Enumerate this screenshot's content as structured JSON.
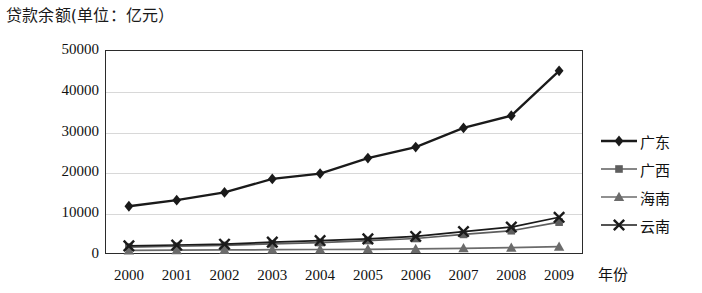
{
  "chart_data": {
    "type": "line",
    "title": "贷款余额(单位：亿元）",
    "xlabel": "年份",
    "ylabel": "",
    "categories": [
      "2000",
      "2001",
      "2002",
      "2003",
      "2004",
      "2005",
      "2006",
      "2007",
      "2008",
      "2009"
    ],
    "ylim": [
      0,
      50000
    ],
    "yticks": [
      "0",
      "10000",
      "20000",
      "30000",
      "40000",
      "50000"
    ],
    "ytick_values": [
      0,
      10000,
      20000,
      30000,
      40000,
      50000
    ],
    "grid": true,
    "legend_position": "right",
    "series": [
      {
        "name": "广东",
        "marker": "diamond",
        "color": "#1a1a1a",
        "values": [
          11700,
          13200,
          15100,
          18400,
          19700,
          23500,
          26200,
          30900,
          33900,
          44900
        ]
      },
      {
        "name": "广西",
        "marker": "square",
        "color": "#5e5e5e",
        "values": [
          1700,
          1900,
          2100,
          2500,
          2800,
          3300,
          3800,
          4800,
          5700,
          7800
        ]
      },
      {
        "name": "海南",
        "marker": "triangle",
        "color": "#6b6b6b",
        "values": [
          900,
          950,
          1000,
          1050,
          1100,
          1150,
          1250,
          1400,
          1550,
          1800
        ]
      },
      {
        "name": "云南",
        "marker": "x",
        "color": "#1a1a1a",
        "values": [
          2000,
          2200,
          2400,
          2900,
          3300,
          3700,
          4300,
          5500,
          6600,
          9000
        ]
      }
    ]
  },
  "axis": {
    "x_title": "年份"
  }
}
